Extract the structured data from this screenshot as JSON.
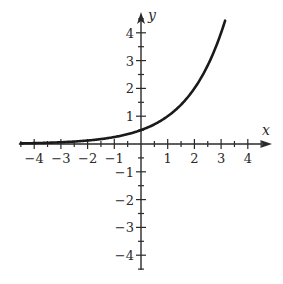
{
  "chart_data": {
    "type": "line",
    "title": "",
    "xlabel": "x",
    "ylabel": "y",
    "xlim": [
      -4.5,
      4.8
    ],
    "ylim": [
      -4.5,
      4.8
    ],
    "grid": false,
    "legend": null,
    "x_ticks": [
      -4,
      -3,
      -2,
      -1,
      1,
      2,
      3,
      4
    ],
    "y_ticks": [
      -4,
      -3,
      -2,
      -1,
      1,
      2,
      3,
      4
    ],
    "x_tick_labels": [
      "−4",
      "−3",
      "−2",
      "−1",
      "1",
      "2",
      "3",
      "4"
    ],
    "y_tick_labels": [
      "−4",
      "−3",
      "−2",
      "−1",
      "1",
      "2",
      "3",
      "4"
    ],
    "minor_tick_step": 0.5,
    "series": [
      {
        "name": "y = 2^(x−1)",
        "function": "0.5 * 2^x",
        "x_range": [
          -4.5,
          3.15
        ],
        "x": [
          -4.5,
          -4,
          -3,
          -2,
          -1,
          0,
          1,
          2,
          3,
          3.15
        ],
        "y": [
          0.022,
          0.031,
          0.063,
          0.125,
          0.25,
          0.5,
          1,
          2,
          4,
          4.44
        ],
        "color": "#1a1a1a"
      }
    ]
  },
  "layout": {
    "origin_px": [
      141,
      144
    ],
    "unit_x_px": 26.7,
    "unit_y_px": 27.8,
    "axis_color": "#2a2a2a",
    "curve_color": "#1a1a1a"
  }
}
